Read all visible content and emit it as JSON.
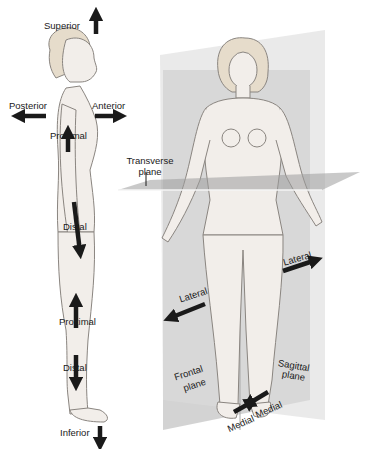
{
  "diagram": {
    "colors": {
      "background": "#ffffff",
      "skin": "#f2eeea",
      "outline": "#8a8580",
      "plane_light": "#e4e4e4",
      "plane_dark": "#b9b9b9",
      "arrow": "#1a1a1a",
      "text": "#1a1a1a"
    },
    "side_figure": {
      "labels": {
        "superior": "Superior",
        "inferior": "Inferior",
        "posterior": "Posterior",
        "anterior": "Anterior",
        "proximal_arm": "Proximal",
        "distal_arm": "Distal",
        "proximal_leg": "Proximal",
        "distal_leg": "Distal"
      }
    },
    "front_figure": {
      "labels": {
        "transverse_line1": "Transverse",
        "transverse_line2": "plane",
        "lateral_left": "Lateral",
        "lateral_right": "Lateral",
        "frontal_line1": "Frontal",
        "frontal_line2": "plane",
        "sagittal_line1": "Sagittal",
        "sagittal_line2": "plane",
        "medial_left": "Medial",
        "medial_right": "Medial"
      }
    }
  }
}
